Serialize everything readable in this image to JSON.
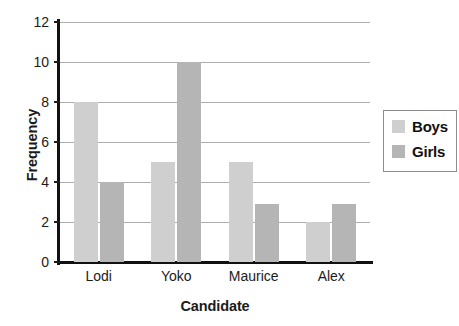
{
  "chart_data": {
    "type": "bar",
    "title": "",
    "xlabel": "Candidate",
    "ylabel": "Frequency",
    "categories": [
      "Lodi",
      "Yoko",
      "Maurice",
      "Alex"
    ],
    "series": [
      {
        "name": "Boys",
        "color": "#cfcfcf",
        "values": [
          8,
          5,
          5,
          2
        ]
      },
      {
        "name": "Girls",
        "color": "#b5b5b5",
        "values": [
          4,
          10,
          2.9,
          2.9
        ]
      }
    ],
    "ylim": [
      0,
      12
    ],
    "ytick_labels": [
      "0",
      "2",
      "4",
      "6",
      "8",
      "10",
      "12"
    ],
    "ytick_values": [
      0,
      2,
      4,
      6,
      8,
      10,
      12
    ],
    "grid": "horizontal",
    "legend_position": "right"
  },
  "legend": {
    "entries": [
      {
        "label": "Boys",
        "color": "#cfcfcf"
      },
      {
        "label": "Girls",
        "color": "#b5b5b5"
      }
    ]
  },
  "axis": {
    "y_title": "Frequency",
    "x_title": "Candidate"
  }
}
